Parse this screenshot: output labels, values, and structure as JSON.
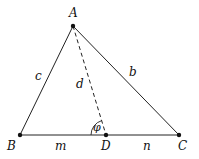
{
  "diagram": {
    "type": "triangle-cevian",
    "stroke_color": "#111111",
    "points": {
      "A": {
        "label": "A",
        "x": 73,
        "y": 26
      },
      "B": {
        "label": "B",
        "x": 20,
        "y": 135
      },
      "C": {
        "label": "C",
        "x": 179,
        "y": 135
      },
      "D": {
        "label": "D",
        "x": 106,
        "y": 135
      }
    },
    "segment_labels": {
      "c": "c",
      "b": "b",
      "d": "d",
      "m": "m",
      "n": "n"
    },
    "angle_label": "φ"
  }
}
